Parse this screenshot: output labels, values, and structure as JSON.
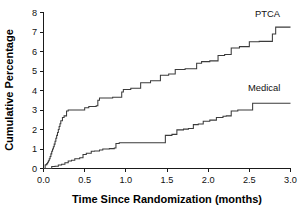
{
  "chart_data": {
    "type": "line",
    "title": "",
    "subtitle": "",
    "xlabel": "Time Since Randomization (months)",
    "ylabel": "Cumulative Percentage",
    "xlim": [
      0.0,
      3.0
    ],
    "ylim": [
      0,
      8
    ],
    "xticks": [
      "0.0",
      "0.5",
      "1.0",
      "1.5",
      "2.0",
      "2.5",
      "3.0"
    ],
    "xtick_values": [
      0.0,
      0.5,
      1.0,
      1.5,
      2.0,
      2.5,
      3.0
    ],
    "yticks": [
      "0",
      "1",
      "2",
      "3",
      "4",
      "5",
      "6",
      "7",
      "8"
    ],
    "ytick_values": [
      0,
      1,
      2,
      3,
      4,
      5,
      6,
      7,
      8
    ],
    "grid": false,
    "legend_position": "inline-end-of-curve",
    "series": [
      {
        "name": "PTCA",
        "label": "PTCA",
        "label_x": 2.72,
        "label_y": 7.75,
        "final_value": 7.25,
        "x": [
          0.0,
          0.02,
          0.03,
          0.04,
          0.05,
          0.06,
          0.07,
          0.08,
          0.09,
          0.1,
          0.11,
          0.12,
          0.13,
          0.14,
          0.15,
          0.16,
          0.17,
          0.18,
          0.19,
          0.2,
          0.21,
          0.23,
          0.25,
          0.28,
          0.3,
          0.42,
          0.5,
          0.55,
          0.64,
          0.66,
          0.68,
          0.84,
          0.95,
          0.97,
          1.06,
          1.18,
          1.3,
          1.42,
          1.52,
          1.6,
          1.72,
          1.86,
          1.92,
          2.02,
          2.12,
          2.2,
          2.28,
          2.38,
          2.5,
          2.62,
          2.78,
          2.82,
          3.0
        ],
        "y": [
          0.0,
          0.18,
          0.2,
          0.25,
          0.32,
          0.4,
          0.5,
          0.62,
          0.75,
          0.88,
          1.0,
          1.12,
          1.25,
          1.4,
          1.55,
          1.7,
          1.85,
          2.0,
          2.15,
          2.3,
          2.45,
          2.62,
          2.7,
          2.95,
          3.0,
          3.0,
          3.12,
          3.18,
          3.22,
          3.5,
          3.62,
          3.65,
          3.92,
          4.05,
          4.12,
          4.4,
          4.5,
          4.78,
          4.85,
          5.08,
          5.12,
          5.4,
          5.48,
          5.52,
          5.8,
          5.85,
          6.18,
          6.25,
          6.5,
          6.52,
          6.9,
          7.25,
          7.25
        ]
      },
      {
        "name": "Medical",
        "label": "Medical",
        "label_x": 2.68,
        "label_y": 3.95,
        "final_value": 3.35,
        "x": [
          0.0,
          0.08,
          0.1,
          0.14,
          0.18,
          0.22,
          0.26,
          0.3,
          0.34,
          0.38,
          0.44,
          0.48,
          0.52,
          0.58,
          0.62,
          0.68,
          0.72,
          0.8,
          0.86,
          0.88,
          0.92,
          1.44,
          1.48,
          1.56,
          1.62,
          1.7,
          1.76,
          1.82,
          1.88,
          1.94,
          2.02,
          2.1,
          2.18,
          2.22,
          2.28,
          2.36,
          2.5,
          2.54,
          3.0
        ],
        "y": [
          0.0,
          0.0,
          0.1,
          0.12,
          0.18,
          0.22,
          0.3,
          0.38,
          0.42,
          0.5,
          0.55,
          0.72,
          0.78,
          0.88,
          0.9,
          0.95,
          1.0,
          1.02,
          1.05,
          1.28,
          1.32,
          1.32,
          1.7,
          1.75,
          1.98,
          2.02,
          2.05,
          2.25,
          2.28,
          2.42,
          2.48,
          2.62,
          2.68,
          2.7,
          2.95,
          3.0,
          3.0,
          3.35,
          3.35
        ]
      }
    ]
  },
  "axes": {
    "y_title": "Cumulative Percentage",
    "x_title": "Time Since Randomization (months)"
  },
  "colors": {
    "line": "#3b3b3b",
    "axis": "#1a1a1a",
    "text": "#111111",
    "background": "#ffffff"
  }
}
